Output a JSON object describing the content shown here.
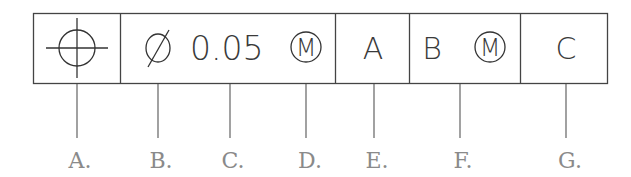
{
  "diagram": {
    "line_color": "#444444",
    "label_color": "#8a8a8a",
    "cells": [
      {
        "id": "A",
        "content_type": "symbol",
        "symbol": "position-icon",
        "text": ""
      },
      {
        "id": "tolerance",
        "diameter_symbol": "Ø",
        "value": "0.05",
        "modifier": "M"
      },
      {
        "id": "E",
        "text": "A"
      },
      {
        "id": "F",
        "text": "B",
        "modifier": "M"
      },
      {
        "id": "G",
        "text": "C"
      }
    ],
    "callouts": [
      {
        "label": "A.",
        "points_to": "position symbol"
      },
      {
        "label": "B.",
        "points_to": "diameter symbol"
      },
      {
        "label": "C.",
        "points_to": "tolerance value"
      },
      {
        "label": "D.",
        "points_to": "material condition modifier"
      },
      {
        "label": "E.",
        "points_to": "primary datum"
      },
      {
        "label": "F.",
        "points_to": "secondary datum with modifier"
      },
      {
        "label": "G.",
        "points_to": "tertiary datum"
      }
    ]
  }
}
